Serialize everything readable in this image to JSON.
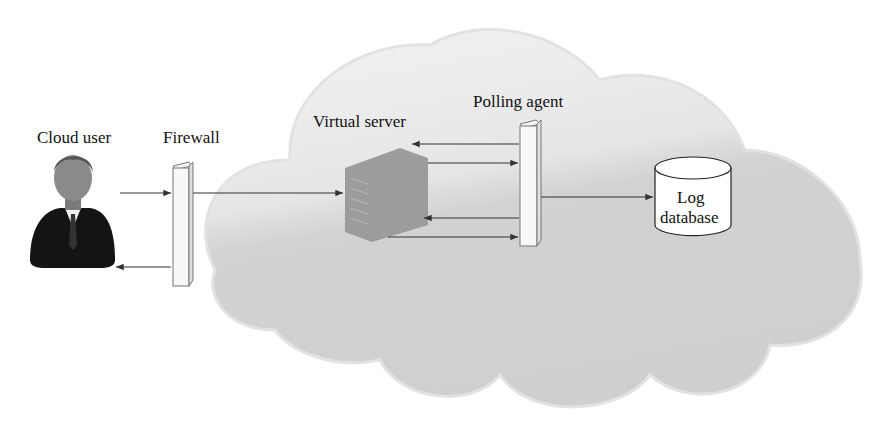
{
  "labels": {
    "cloud_user": "Cloud user",
    "firewall": "Firewall",
    "virtual_server": "Virtual server",
    "polling_agent": "Polling agent",
    "log_db_line1": "Log",
    "log_db_line2": "database"
  },
  "colors": {
    "cloud_light": "#ececec",
    "cloud_dark": "#d4d4d4",
    "server": "#9a9a9a",
    "arrow": "#333333"
  }
}
